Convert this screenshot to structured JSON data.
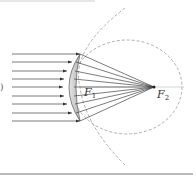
{
  "diagram": {
    "labels": {
      "f1": {
        "main": "F",
        "sub": "1"
      },
      "f2": {
        "main": "F",
        "sub": "2"
      },
      "edge_mark": ")"
    },
    "rays_count": 9,
    "colors": {
      "ray": "#444444",
      "lens_fill": "#c8c8c8",
      "dashed": "#9a9a9a",
      "rule": "#777777"
    }
  }
}
